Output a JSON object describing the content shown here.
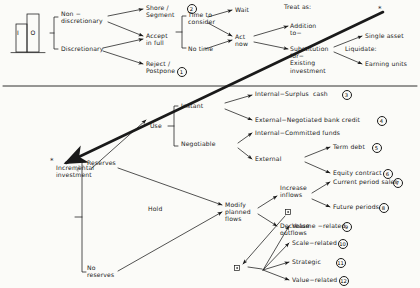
{
  "diagram": {
    "title_icon": {
      "name": "io-bar-icon",
      "bar_left_label": "I",
      "bar_right_label": "O"
    },
    "divider": true,
    "labels": {
      "non_discretionary": "Non −\ndiscretionary",
      "discretionary": "Discretionary",
      "share_segment": "Shore /\nSegment",
      "accept_in_full": "Accept\nin full",
      "reject_postpone": "Reject /\nPostpone",
      "time_to_consider": "Time to\nconsider",
      "no_time": "No time",
      "wait": "Wait",
      "act_now": "Act\nnow",
      "treat_as": "Treat as:",
      "addition_to": "Addition\nto−",
      "substitution": "Substitution\nfor−\nExisting\ninvestment",
      "single_asset": "Single asset",
      "liquidate": "Liquidate:",
      "earning_units": "Earning units",
      "star_top": "*",
      "incremental_investment": "Incremental\ninvestment",
      "star_left": "*",
      "reserves": "Reserves",
      "no_reserves": "No\nreserves",
      "use": "Use",
      "hold": "Hold",
      "instant": "Instant",
      "negotiable": "Negotiable",
      "internal_surplus_cash": "Internal−Surplus  cash",
      "external_negotiated_bank_credit": "External−Negotiated bank credit",
      "internal_committed_funds": "Internal−Committed funds",
      "external": "External",
      "term_debt": "Term debt",
      "equity_contract": "Equity contract",
      "modify_planned_flows": "Modify\nplanned\nflows",
      "increase_inflows": "Increase\ninflows",
      "decrease_outflows": "Decrease\noutflows",
      "current_period_sales": "Current period sales",
      "future_periods": "Future periods",
      "volume_related": "Volume −related",
      "scale_related": "Scale−related",
      "strategic": "Strategic",
      "value_related": "Value−related"
    },
    "circled_numbers": {
      "reject_postpone": "1",
      "share_segment": "2",
      "internal_surplus_cash": "3",
      "external_negotiated_bank_credit": "4",
      "term_debt": "5",
      "equity_contract": "6",
      "current_period_sales": "7",
      "future_periods": "8",
      "volume_related": "9",
      "scale_related": "10",
      "strategic": "11",
      "value_related": "12"
    },
    "colors": {
      "ink": "#1a1a1a",
      "paper": "#fbfbf8"
    }
  }
}
